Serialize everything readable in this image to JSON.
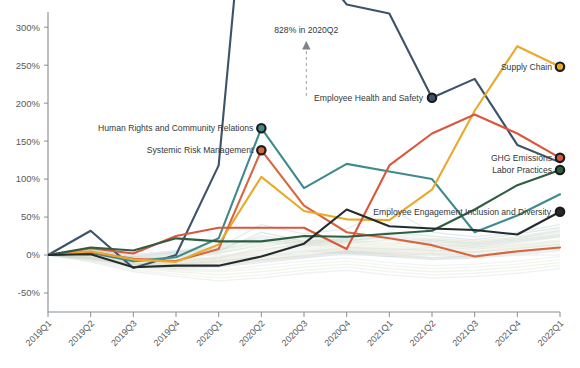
{
  "chart_data": {
    "type": "line",
    "title": "",
    "xlabel": "",
    "ylabel": "",
    "ylim": [
      -75,
      320
    ],
    "ytick_values": [
      300,
      250,
      200,
      150,
      100,
      50,
      0,
      -50
    ],
    "ytick_labels": [
      "300%",
      "250%",
      "200%",
      "150%",
      "100%",
      "50%",
      "0%",
      "-50%"
    ],
    "grid": false,
    "legend_position": "inline-endpoint-labels",
    "categories": [
      "2019Q1",
      "2019Q2",
      "2019Q3",
      "2019Q4",
      "2020Q1",
      "2020Q2",
      "2020Q3",
      "2020Q4",
      "2021Q1",
      "2021Q2",
      "2021Q3",
      "2021Q4",
      "2022Q1"
    ],
    "annotations": [
      {
        "text": "828% in 2020Q2",
        "target_category": "2020Q2",
        "target_value": 828,
        "note": "off-chart peak of Employee Health and Safety"
      }
    ],
    "series": [
      {
        "name": "Employee Health and Safety",
        "color": "#3d526b",
        "highlighted": true,
        "label_side": "left",
        "label_at_category": "2021Q2",
        "values": [
          0,
          32,
          -17,
          0,
          118,
          828,
          400,
          330,
          318,
          207,
          232,
          145,
          122
        ]
      },
      {
        "name": "Human Rights and Community Relations",
        "color": "#3f8a8c",
        "highlighted": true,
        "label_side": "left",
        "label_at_category": "2020Q2",
        "values": [
          0,
          3,
          -8,
          -3,
          22,
          167,
          88,
          120,
          110,
          100,
          30,
          52,
          80
        ]
      },
      {
        "name": "Systemic Risk Management",
        "color": "#d9663f",
        "highlighted": true,
        "label_side": "left",
        "label_at_category": "2020Q2",
        "values": [
          0,
          4,
          -5,
          -8,
          8,
          138,
          65,
          30,
          22,
          13,
          -2,
          5,
          10
        ]
      },
      {
        "name": "Supply Chain",
        "color": "#e9a92b",
        "highlighted": true,
        "label_side": "right",
        "values": [
          0,
          5,
          -6,
          -9,
          14,
          103,
          58,
          47,
          46,
          86,
          190,
          275,
          248
        ]
      },
      {
        "name": "GHG Emissions",
        "color": "#d9573c",
        "highlighted": true,
        "label_side": "right",
        "values": [
          0,
          9,
          2,
          25,
          36,
          36,
          36,
          8,
          118,
          160,
          185,
          160,
          128
        ]
      },
      {
        "name": "Labor Practices",
        "color": "#2d5e42",
        "highlighted": true,
        "label_side": "right",
        "values": [
          0,
          10,
          6,
          22,
          18,
          18,
          25,
          24,
          28,
          32,
          60,
          92,
          112
        ]
      },
      {
        "name": "Employee Engagement Inclusion and Diversity",
        "color": "#232b2b",
        "highlighted": true,
        "label_side": "left",
        "values": [
          0,
          1,
          -16,
          -14,
          -14,
          -2,
          15,
          60,
          38,
          35,
          33,
          27,
          57
        ]
      }
    ],
    "background_series": [
      {
        "color": "#9fb7cc",
        "values": [
          0,
          6,
          -4,
          -2,
          5,
          30,
          18,
          22,
          30,
          25,
          20,
          28,
          36
        ]
      },
      {
        "color": "#c9d6b0",
        "values": [
          0,
          -2,
          -10,
          -12,
          -8,
          -2,
          4,
          10,
          8,
          6,
          4,
          9,
          14
        ]
      },
      {
        "color": "#e4d9a3",
        "values": [
          0,
          3,
          -6,
          -8,
          -4,
          10,
          20,
          16,
          12,
          18,
          14,
          20,
          26
        ]
      },
      {
        "color": "#b8c9d6",
        "values": [
          0,
          -5,
          -14,
          -18,
          -16,
          -10,
          -4,
          2,
          -2,
          -6,
          -4,
          0,
          6
        ]
      },
      {
        "color": "#cfe0d4",
        "values": [
          0,
          2,
          -8,
          -6,
          -2,
          8,
          14,
          10,
          6,
          10,
          8,
          12,
          18
        ]
      },
      {
        "color": "#d8cfa8",
        "values": [
          0,
          -3,
          -12,
          -14,
          -10,
          -6,
          0,
          6,
          2,
          0,
          -2,
          4,
          10
        ]
      },
      {
        "color": "#a9c3d4",
        "values": [
          0,
          8,
          -2,
          4,
          10,
          40,
          28,
          34,
          62,
          30,
          24,
          30,
          40
        ]
      },
      {
        "color": "#dfe3c0",
        "values": [
          0,
          -6,
          -16,
          -20,
          -22,
          -18,
          -12,
          -8,
          -14,
          -18,
          -16,
          -12,
          -6
        ]
      },
      {
        "color": "#c5d8c0",
        "values": [
          0,
          4,
          -6,
          -4,
          2,
          14,
          22,
          18,
          14,
          20,
          16,
          22,
          30
        ]
      },
      {
        "color": "#e0d6b8",
        "values": [
          0,
          -4,
          -13,
          -16,
          -14,
          -8,
          -2,
          4,
          0,
          -4,
          -2,
          3,
          9
        ]
      },
      {
        "color": "#b6cdd9",
        "values": [
          0,
          7,
          -1,
          3,
          8,
          26,
          16,
          20,
          24,
          18,
          14,
          20,
          28
        ]
      },
      {
        "color": "#d4dfc2",
        "values": [
          0,
          -7,
          -18,
          -22,
          -26,
          -22,
          -16,
          -12,
          -18,
          -22,
          -20,
          -16,
          -10
        ]
      },
      {
        "color": "#cad9e0",
        "values": [
          0,
          1,
          -9,
          -10,
          -6,
          2,
          10,
          6,
          2,
          6,
          4,
          8,
          14
        ]
      },
      {
        "color": "#e6dcc0",
        "values": [
          0,
          -1,
          -11,
          -13,
          -9,
          -4,
          2,
          8,
          4,
          2,
          0,
          5,
          11
        ]
      },
      {
        "color": "#bdd2c6",
        "values": [
          0,
          5,
          -3,
          1,
          6,
          18,
          12,
          16,
          20,
          14,
          10,
          16,
          24
        ]
      },
      {
        "color": "#dbe2cc",
        "values": [
          0,
          -8,
          -20,
          -25,
          -30,
          -26,
          -20,
          -16,
          -22,
          -26,
          -24,
          -20,
          -14
        ]
      },
      {
        "color": "#c0d0dd",
        "values": [
          0,
          9,
          0,
          6,
          12,
          22,
          14,
          18,
          26,
          20,
          16,
          22,
          32
        ]
      },
      {
        "color": "#e2ddb4",
        "values": [
          0,
          -2,
          -7,
          -9,
          -5,
          4,
          12,
          8,
          4,
          8,
          6,
          10,
          16
        ]
      },
      {
        "color": "#cedcd0",
        "values": [
          0,
          3,
          -5,
          -3,
          3,
          12,
          18,
          14,
          10,
          14,
          12,
          18,
          24
        ]
      },
      {
        "color": "#d0dae6",
        "values": [
          0,
          -6,
          -15,
          -19,
          -20,
          -14,
          -8,
          -4,
          -10,
          -14,
          -12,
          -8,
          -2
        ]
      },
      {
        "color": "#e8e0bc",
        "values": [
          0,
          0,
          -10,
          -11,
          -7,
          0,
          8,
          4,
          0,
          4,
          2,
          6,
          12
        ]
      },
      {
        "color": "#c4d4c8",
        "values": [
          0,
          6,
          -2,
          2,
          7,
          20,
          15,
          19,
          22,
          16,
          12,
          18,
          26
        ]
      },
      {
        "color": "#b2c6d6",
        "values": [
          0,
          -4,
          -12,
          -15,
          -12,
          -6,
          -1,
          5,
          1,
          -3,
          -1,
          4,
          10
        ]
      },
      {
        "color": "#ddd8ae",
        "values": [
          0,
          2,
          -9,
          -7,
          -3,
          6,
          16,
          12,
          8,
          12,
          10,
          14,
          20
        ]
      },
      {
        "color": "#c8d9dd",
        "values": [
          0,
          -9,
          -22,
          -28,
          -34,
          -30,
          -24,
          -20,
          -26,
          -30,
          -28,
          -24,
          -18
        ]
      },
      {
        "color": "#d6e0c4",
        "values": [
          0,
          4,
          -4,
          0,
          4,
          16,
          24,
          20,
          16,
          22,
          18,
          24,
          32
        ]
      },
      {
        "color": "#bfd1e0",
        "values": [
          0,
          -3,
          -11,
          -12,
          -8,
          -2,
          6,
          2,
          -2,
          2,
          0,
          4,
          10
        ]
      },
      {
        "color": "#e4deb6",
        "values": [
          0,
          7,
          1,
          5,
          9,
          24,
          17,
          21,
          28,
          22,
          18,
          24,
          34
        ]
      },
      {
        "color": "#ccd9c6",
        "values": [
          0,
          -5,
          -13,
          -17,
          -14,
          -8,
          -3,
          3,
          -1,
          -5,
          -3,
          2,
          8
        ]
      },
      {
        "color": "#d2dee8",
        "values": [
          0,
          1,
          -8,
          -9,
          -4,
          6,
          14,
          10,
          6,
          10,
          8,
          12,
          18
        ]
      }
    ]
  },
  "axes": {
    "y_tick_labels": [
      "300%",
      "250%",
      "200%",
      "150%",
      "100%",
      "50%",
      "0%",
      "-50%"
    ],
    "x_tick_labels": [
      "2019Q1",
      "2019Q2",
      "2019Q3",
      "2019Q4",
      "2020Q1",
      "2020Q2",
      "2020Q3",
      "2020Q4",
      "2021Q1",
      "2021Q2",
      "2021Q3",
      "2021Q4",
      "2022Q1"
    ]
  },
  "labels": {
    "annotation": "828% in 2020Q2",
    "human_rights": "Human Rights and Community Relations",
    "systemic_risk": "Systemic Risk Management",
    "employee_health": "Employee Health and Safety",
    "supply_chain": "Supply Chain",
    "ghg_emissions": "GHG Emissions",
    "labor_practices": "Labor Practices",
    "employee_engagement": "Employee Engagement Inclusion and Diversity"
  }
}
